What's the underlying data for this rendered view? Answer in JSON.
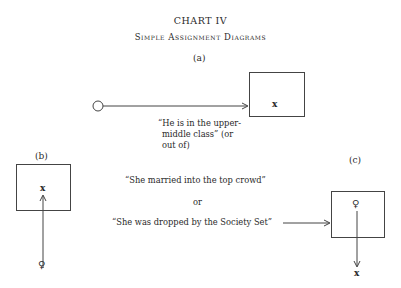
{
  "header": {
    "title": "CHART IV",
    "subtitle": "Simple Assignment Diagrams"
  },
  "panels": {
    "a": {
      "label": "(a)",
      "box_mark": "x",
      "caption_lines": [
        "“He is in the upper-",
        "middle class” (or",
        "out of)"
      ]
    },
    "b": {
      "label": "(b)",
      "box_mark": "x",
      "origin_mark": "♀"
    },
    "c": {
      "label": "(c)",
      "box_mark": "♀",
      "exit_mark": "x"
    }
  },
  "center_text": {
    "line1": "“She married into the top crowd”",
    "or": "or",
    "line2": "“She was dropped by the Society Set”"
  },
  "colors": {
    "ink": "#2a2a2a",
    "line": "#444444",
    "background": "#ffffff"
  }
}
